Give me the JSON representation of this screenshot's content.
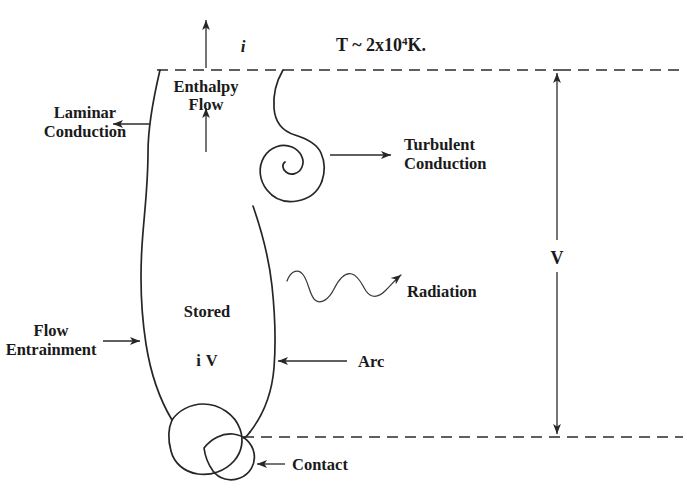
{
  "figure": {
    "title_text": "",
    "domain": "diagram",
    "background_color": "#ffffff",
    "line_color": "#262626",
    "text_color": "#1a1a1a"
  },
  "annotations": {
    "temperature": {
      "prefix": "T  ~  2x10",
      "exponent": "4",
      "suffix": "K."
    },
    "current_top": "i",
    "enthalpy_flow_line1": "Enthalpy",
    "enthalpy_flow_line2": "Flow",
    "laminar_conduction_line1": "Laminar",
    "laminar_conduction_line2": "Conduction",
    "turbulent_conduction_line1": "Turbulent",
    "turbulent_conduction_line2": "Conduction",
    "radiation": "Radiation",
    "stored": "Stored",
    "stored_value_italic": "i",
    "stored_value_upright": "V",
    "flow_entrainment_line1": "Flow",
    "flow_entrainment_line2": "Entrainment",
    "arc": "Arc",
    "contact": "Contact",
    "voltage": "V"
  },
  "elements": {
    "top_boundary_name": "top-electrode-plane",
    "bottom_boundary_name": "bottom-electrode-plane",
    "plasma_column_name": "arc-plasma-column",
    "vortex_name": "turbulence-vortex-spiral",
    "contact_blob_name": "contact-blob",
    "voltage_arrow_name": "voltage-span-arrow"
  }
}
